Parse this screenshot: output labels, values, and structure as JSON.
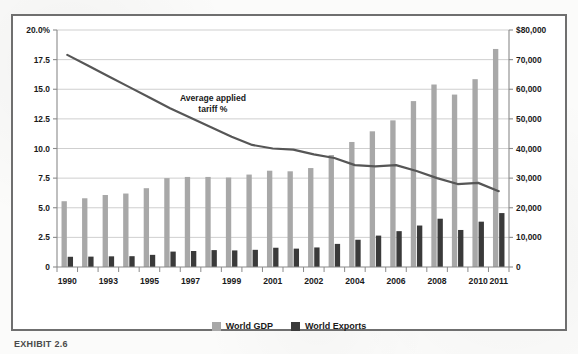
{
  "exhibit": {
    "caption": "EXHIBIT 2.6"
  },
  "legend": {
    "position": "bottom-center",
    "items": [
      {
        "label": "World GDP",
        "color": "#a8a8a8",
        "name": "legend-world-gdp"
      },
      {
        "label": "World Exports",
        "color": "#3a3a3a",
        "name": "legend-world-exports"
      }
    ]
  },
  "annotation": {
    "line1": "Average applied",
    "line2": "tariff %"
  },
  "chart_data": {
    "type": "bar",
    "title": "",
    "subtitle": "",
    "xlabel": "",
    "ylabel": "",
    "grid": true,
    "legend_position": "bottom-center",
    "categories": [
      "1990",
      "1991",
      "1992",
      "1993",
      "1994",
      "1995",
      "1996",
      "1997",
      "1998",
      "1999",
      "2000",
      "2001",
      "2002",
      "2003",
      "2004",
      "2005",
      "2006",
      "2007",
      "2008",
      "2009",
      "2010",
      "2011"
    ],
    "tick_labels_shown": [
      "1990",
      "",
      "1993",
      "",
      "1995",
      "",
      "1997",
      "",
      "1999",
      "",
      "2001",
      "",
      "2002",
      "",
      "2004",
      "",
      "2006",
      "",
      "2008",
      "",
      "2010",
      "2011"
    ],
    "axes": {
      "left": {
        "label": "",
        "ylim": [
          0,
          20
        ],
        "ticks": [
          0,
          2.5,
          5.0,
          7.5,
          10.0,
          12.5,
          15.0,
          17.5,
          20.0
        ],
        "tick_labels": [
          "0",
          "2.5",
          "5.0",
          "7.5",
          "10.0",
          "12.5",
          "15.0",
          "17.5",
          "20.0%"
        ],
        "units": "percent"
      },
      "right": {
        "label": "",
        "ylim": [
          0,
          80000
        ],
        "ticks": [
          0,
          10000,
          20000,
          30000,
          40000,
          50000,
          60000,
          70000,
          80000
        ],
        "tick_labels": [
          "0",
          "10,000",
          "20,000",
          "30,000",
          "40,000",
          "50,000",
          "60,000",
          "70,000",
          "$80,000"
        ],
        "units": "USD billions"
      }
    },
    "series": [
      {
        "name": "World GDP",
        "type": "bar",
        "axis": "right",
        "color": "#a8a8a8",
        "values": [
          22200,
          23200,
          24300,
          24800,
          26600,
          30000,
          30400,
          30400,
          30200,
          31200,
          32500,
          32300,
          33400,
          37800,
          42200,
          45800,
          49500,
          56000,
          61600,
          58200,
          63400,
          73600
        ]
      },
      {
        "name": "World Exports",
        "type": "bar",
        "axis": "right",
        "color": "#3a3a3a",
        "values": [
          3450,
          3500,
          3600,
          3650,
          4100,
          5200,
          5400,
          5700,
          5600,
          5800,
          6500,
          6200,
          6600,
          7800,
          9200,
          10600,
          12100,
          14000,
          16300,
          12500,
          15300,
          18200
        ]
      },
      {
        "name": "Average applied tariff %",
        "type": "line",
        "axis": "left",
        "color": "#565656",
        "values": [
          17.9,
          17.0,
          16.1,
          15.2,
          14.3,
          13.4,
          12.6,
          11.8,
          11.0,
          10.3,
          10.0,
          9.9,
          9.5,
          9.2,
          8.6,
          8.5,
          8.6,
          8.1,
          7.5,
          7.0,
          7.1,
          6.4
        ]
      }
    ]
  }
}
